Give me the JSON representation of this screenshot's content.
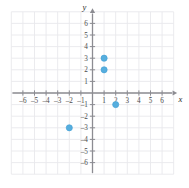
{
  "figure": {
    "kind": "coordinate-plane-scatter",
    "background_color": "#ffffff",
    "grid_color": "#e9e9ec",
    "axis_color": "#8c8c92",
    "tick_color": "#8c8c92",
    "label_color": "#4b4b4b",
    "point_color": "#56aede",
    "point_edge_color": "#3f9ed3"
  },
  "chart_data": {
    "type": "scatter",
    "title": "",
    "xlabel": "x",
    "ylabel": "y",
    "xlim": [
      -7,
      7
    ],
    "ylim": [
      -7,
      7
    ],
    "grid": true,
    "legend": "none",
    "x_tick_labels": [
      "-6",
      "-5",
      "-4",
      "-3",
      "-2",
      "-1",
      "1",
      "2",
      "3",
      "4",
      "5",
      "6"
    ],
    "x_tick_values": [
      -6,
      -5,
      -4,
      -3,
      -2,
      -1,
      1,
      2,
      3,
      4,
      5,
      6
    ],
    "y_tick_labels": [
      "6",
      "5",
      "4",
      "3",
      "2",
      "1",
      "-1",
      "-2",
      "-3",
      "-4",
      "-5",
      "-6"
    ],
    "y_tick_values": [
      6,
      5,
      4,
      3,
      2,
      1,
      -1,
      -2,
      -3,
      -4,
      -5,
      -6
    ],
    "points": [
      {
        "label": "(1, 3)",
        "x": 1,
        "y": 3
      },
      {
        "label": "(1, 2)",
        "x": 1,
        "y": 2
      },
      {
        "label": "(2, -1)",
        "x": 2,
        "y": -1
      },
      {
        "label": "(-2, -3)",
        "x": -2,
        "y": -3
      }
    ]
  }
}
